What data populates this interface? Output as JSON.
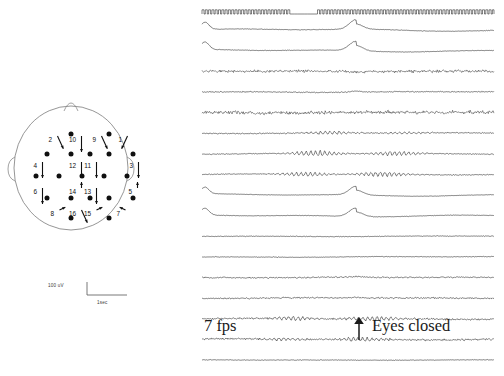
{
  "figure": {
    "type": "eeg-recording",
    "background": "#ffffff",
    "ink_color": "#1a1a1a"
  },
  "montage": {
    "title": "",
    "head_outline": {
      "shape": "ellipse-with-nose-and-ears",
      "stroke": "#8a8a8a"
    },
    "electrode_color": "#101010",
    "electrode_rows": [
      {
        "y": 28,
        "xs": [
          57,
          95
        ]
      },
      {
        "y": 48,
        "xs": [
          33,
          57,
          76,
          95,
          119
        ]
      },
      {
        "y": 70,
        "xs": [
          22,
          45,
          68,
          90,
          113
        ]
      },
      {
        "y": 92,
        "xs": [
          33,
          57,
          76,
          95,
          119
        ]
      },
      {
        "y": 112,
        "xs": [
          57,
          95
        ]
      }
    ],
    "derivations": [
      {
        "label": "1",
        "x": 108,
        "y": 36
      },
      {
        "label": "2",
        "x": 38,
        "y": 36
      },
      {
        "label": "3",
        "x": 119,
        "y": 62
      },
      {
        "label": "4",
        "x": 23,
        "y": 62
      },
      {
        "label": "5",
        "x": 118,
        "y": 88
      },
      {
        "label": "6",
        "x": 23,
        "y": 88
      },
      {
        "label": "7",
        "x": 106,
        "y": 110
      },
      {
        "label": "8",
        "x": 40,
        "y": 110
      },
      {
        "label": "9",
        "x": 82,
        "y": 36
      },
      {
        "label": "10",
        "x": 62,
        "y": 36
      },
      {
        "label": "11",
        "x": 77,
        "y": 62
      },
      {
        "label": "12",
        "x": 62,
        "y": 62
      },
      {
        "label": "13",
        "x": 77,
        "y": 88
      },
      {
        "label": "14",
        "x": 62,
        "y": 88
      },
      {
        "label": "15",
        "x": 77,
        "y": 110
      },
      {
        "label": "16",
        "x": 62,
        "y": 110
      }
    ]
  },
  "scalebar": {
    "amplitude_label": "100 uV",
    "time_label": "1sec",
    "amplitude_value": 100,
    "amplitude_unit": "uV",
    "time_value": 1,
    "time_unit": "sec"
  },
  "annotations": {
    "stimulus_label": "7 fps",
    "event_label": "Eyes closed",
    "event_marker_icon": "up-arrow-icon"
  },
  "chart_data": {
    "type": "line",
    "title": "",
    "xlabel": "Time",
    "ylabel": "Channel",
    "grid": false,
    "legend": "none",
    "x_range": [
      0,
      302
    ],
    "n_channels": 16,
    "marker_channel": {
      "name": "photic-stimulus-marker",
      "description": "square pulse train at 7 flashes per second with a gap",
      "pulses_per_second": 7,
      "gap_start": 94,
      "gap_end": 120
    },
    "event_markers": [
      {
        "label": "Eyes closed",
        "x": 160
      }
    ],
    "series": [
      {
        "name": "ch1",
        "trace": "blink",
        "amp": 1.0,
        "noise": 0.22,
        "alpha": 0.0,
        "alpha_start": 0,
        "alpha_end": 0
      },
      {
        "name": "ch2",
        "trace": "blink",
        "amp": 1.0,
        "noise": 0.22,
        "alpha": 0.0,
        "alpha_start": 0,
        "alpha_end": 0
      },
      {
        "name": "ch3",
        "trace": "emg",
        "amp": 0.3,
        "noise": 1.1,
        "alpha": 0.0,
        "alpha_start": 0,
        "alpha_end": 0
      },
      {
        "name": "ch4",
        "trace": "mixed",
        "amp": 0.4,
        "noise": 0.45,
        "alpha": 0.0,
        "alpha_start": 0,
        "alpha_end": 0
      },
      {
        "name": "ch5",
        "trace": "emg",
        "amp": 0.3,
        "noise": 1.35,
        "alpha": 0.0,
        "alpha_start": 0,
        "alpha_end": 0
      },
      {
        "name": "ch6",
        "trace": "alpha",
        "amp": 0.4,
        "noise": 0.45,
        "alpha": 1.15,
        "alpha_start": 60,
        "alpha_end": 300
      },
      {
        "name": "ch7",
        "trace": "alpha",
        "amp": 0.4,
        "noise": 0.38,
        "alpha": 2.2,
        "alpha_start": 55,
        "alpha_end": 300
      },
      {
        "name": "ch8",
        "trace": "alpha",
        "amp": 0.4,
        "noise": 0.38,
        "alpha": 2.0,
        "alpha_start": 55,
        "alpha_end": 300
      },
      {
        "name": "ch9",
        "trace": "blink",
        "amp": 0.9,
        "noise": 0.18,
        "alpha": 0.0,
        "alpha_start": 0,
        "alpha_end": 0
      },
      {
        "name": "ch10",
        "trace": "blink",
        "amp": 0.9,
        "noise": 0.2,
        "alpha": 0.0,
        "alpha_start": 0,
        "alpha_end": 0
      },
      {
        "name": "ch11",
        "trace": "flat",
        "amp": 0.3,
        "noise": 0.3,
        "alpha": 0.0,
        "alpha_start": 0,
        "alpha_end": 0
      },
      {
        "name": "ch12",
        "trace": "flat",
        "amp": 0.3,
        "noise": 0.3,
        "alpha": 0.0,
        "alpha_start": 0,
        "alpha_end": 0
      },
      {
        "name": "ch13",
        "trace": "mixed",
        "amp": 0.3,
        "noise": 0.55,
        "alpha": 0.35,
        "alpha_start": 70,
        "alpha_end": 300
      },
      {
        "name": "ch14",
        "trace": "mixed",
        "amp": 0.3,
        "noise": 0.55,
        "alpha": 0.3,
        "alpha_start": 70,
        "alpha_end": 300
      },
      {
        "name": "ch15",
        "trace": "alpha",
        "amp": 0.4,
        "noise": 0.7,
        "alpha": 1.7,
        "alpha_start": 40,
        "alpha_end": 300
      },
      {
        "name": "ch16",
        "trace": "alpha",
        "amp": 0.4,
        "noise": 0.7,
        "alpha": 1.45,
        "alpha_start": 40,
        "alpha_end": 300
      },
      {
        "name": "ch17",
        "trace": "flat",
        "amp": 0.2,
        "noise": 0.28,
        "alpha": 0.0,
        "alpha_start": 0,
        "alpha_end": 0
      }
    ]
  }
}
